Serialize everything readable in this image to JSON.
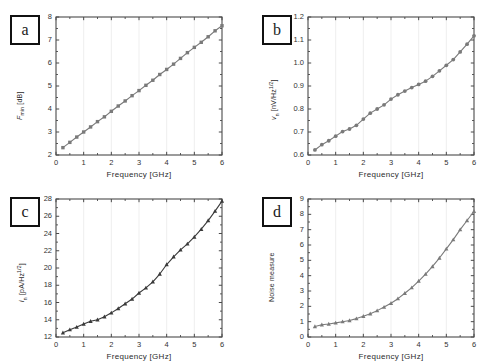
{
  "figure": {
    "width": 504,
    "height": 364,
    "background": "#ffffff",
    "line_color": "#7a7a7a",
    "marker_color": "#6e6e6e",
    "dark_line_color": "#3a3a3a",
    "axis_color": "#4a4a4a",
    "grid_color": "#e8e8e8"
  },
  "panels": {
    "a": {
      "tag": "a"
    },
    "b": {
      "tag": "b"
    },
    "c": {
      "tag": "c"
    },
    "d": {
      "tag": "d"
    }
  },
  "chart_data": [
    {
      "id": "a",
      "type": "line",
      "title": "",
      "panel_label": "a",
      "xlabel": "Frequency [GHz]",
      "ylabel": "F_min [dB]",
      "ylabel_parts": {
        "base": "F",
        "sub": "min",
        "unit": "[dB]"
      },
      "xlim": [
        0,
        6
      ],
      "ylim": [
        2,
        8
      ],
      "xticks": [
        0,
        1,
        2,
        3,
        4,
        5,
        6
      ],
      "xticklabels": [
        "0",
        "1",
        "2",
        "3",
        "4",
        "5",
        "6"
      ],
      "yticks": [
        2,
        3,
        4,
        5,
        6,
        7,
        8
      ],
      "yticklabels": [
        "2",
        "3",
        "4",
        "5",
        "6",
        "7",
        "8"
      ],
      "grid": true,
      "marker": "square",
      "line_color": "#7a7a7a",
      "x": [
        0.25,
        0.5,
        0.75,
        1.0,
        1.25,
        1.5,
        1.75,
        2.0,
        2.25,
        2.5,
        2.75,
        3.0,
        3.25,
        3.5,
        3.75,
        4.0,
        4.25,
        4.5,
        4.75,
        5.0,
        5.25,
        5.5,
        5.75,
        6.0
      ],
      "y": [
        2.32,
        2.55,
        2.78,
        3.0,
        3.22,
        3.45,
        3.66,
        3.9,
        4.13,
        4.35,
        4.58,
        4.8,
        5.03,
        5.25,
        5.5,
        5.72,
        5.95,
        6.2,
        6.45,
        6.68,
        6.9,
        7.14,
        7.4,
        7.62
      ]
    },
    {
      "id": "b",
      "type": "line",
      "title": "",
      "panel_label": "b",
      "xlabel": "Frequency [GHz]",
      "ylabel": "v_n [nV/Hz^1/2]",
      "ylabel_parts": {
        "base": "v",
        "sub": "n",
        "unit": "[nV/Hz",
        "sup": "1/2",
        "unit_end": "]"
      },
      "xlim": [
        0,
        6
      ],
      "ylim": [
        0.6,
        1.2
      ],
      "xticks": [
        0,
        1,
        2,
        3,
        4,
        5,
        6
      ],
      "xticklabels": [
        "0",
        "1",
        "2",
        "3",
        "4",
        "5",
        "6"
      ],
      "yticks": [
        0.6,
        0.7,
        0.8,
        0.9,
        1.0,
        1.1,
        1.2
      ],
      "yticklabels": [
        "0.6",
        "0.7",
        "0.8",
        "0.9",
        "1.0",
        "1.1",
        "1.2"
      ],
      "grid": true,
      "marker": "circle",
      "line_color": "#7a7a7a",
      "x": [
        0.25,
        0.5,
        0.75,
        1.0,
        1.25,
        1.5,
        1.75,
        2.0,
        2.25,
        2.5,
        2.75,
        3.0,
        3.25,
        3.5,
        3.75,
        4.0,
        4.25,
        4.5,
        4.75,
        5.0,
        5.25,
        5.5,
        5.75,
        6.0
      ],
      "y": [
        0.622,
        0.645,
        0.662,
        0.682,
        0.702,
        0.713,
        0.729,
        0.756,
        0.782,
        0.8,
        0.818,
        0.843,
        0.862,
        0.878,
        0.893,
        0.907,
        0.921,
        0.942,
        0.966,
        0.99,
        1.015,
        1.048,
        1.082,
        1.118,
        1.152,
        1.198
      ]
    },
    {
      "id": "c",
      "type": "line",
      "title": "",
      "panel_label": "c",
      "xlabel": "Frequency [GHz]",
      "ylabel": "i_n [pA/Hz^1/2]",
      "ylabel_parts": {
        "base": "i",
        "sub": "n",
        "unit": "[pA/Hz",
        "sup": "1/2",
        "unit_end": "]"
      },
      "xlim": [
        0,
        6
      ],
      "ylim": [
        12,
        28
      ],
      "xticks": [
        0,
        1,
        2,
        3,
        4,
        5,
        6
      ],
      "xticklabels": [
        "0",
        "1",
        "2",
        "3",
        "4",
        "5",
        "6"
      ],
      "yticks": [
        12,
        14,
        16,
        18,
        20,
        22,
        24,
        26,
        28
      ],
      "yticklabels": [
        "12",
        "14",
        "16",
        "18",
        "20",
        "22",
        "24",
        "26",
        "28"
      ],
      "grid": true,
      "marker": "triangle",
      "line_color": "#3a3a3a",
      "x": [
        0.25,
        0.5,
        0.75,
        1.0,
        1.25,
        1.5,
        1.75,
        2.0,
        2.25,
        2.5,
        2.75,
        3.0,
        3.25,
        3.5,
        3.75,
        4.0,
        4.25,
        4.5,
        4.75,
        5.0,
        5.25,
        5.5,
        5.75,
        6.0
      ],
      "y": [
        12.5,
        12.85,
        13.15,
        13.5,
        13.82,
        14.0,
        14.35,
        14.8,
        15.3,
        15.85,
        16.4,
        17.1,
        17.7,
        18.4,
        19.3,
        20.4,
        21.3,
        22.1,
        22.8,
        23.6,
        24.5,
        25.5,
        26.6,
        27.75
      ]
    },
    {
      "id": "d",
      "type": "line",
      "title": "",
      "panel_label": "d",
      "xlabel": "Frequency [GHz]",
      "ylabel": "Noise measure",
      "ylabel_parts": {
        "base": "Noise measure",
        "sub": "",
        "unit": ""
      },
      "xlim": [
        0,
        6
      ],
      "ylim": [
        0,
        9
      ],
      "xticks": [
        0,
        1,
        2,
        3,
        4,
        5,
        6
      ],
      "xticklabels": [
        "0",
        "1",
        "2",
        "3",
        "4",
        "5",
        "6"
      ],
      "yticks": [
        0,
        1,
        2,
        3,
        4,
        5,
        6,
        7,
        8,
        9
      ],
      "yticklabels": [
        "0",
        "1",
        "2",
        "3",
        "4",
        "5",
        "6",
        "7",
        "8",
        "9"
      ],
      "grid": true,
      "marker": "triangle",
      "line_color": "#7a7a7a",
      "x": [
        0.25,
        0.5,
        0.75,
        1.0,
        1.25,
        1.5,
        1.75,
        2.0,
        2.25,
        2.5,
        2.75,
        3.0,
        3.25,
        3.5,
        3.75,
        4.0,
        4.25,
        4.5,
        4.75,
        5.0,
        5.25,
        5.5,
        5.75,
        6.0
      ],
      "y": [
        0.68,
        0.8,
        0.85,
        0.92,
        1.0,
        1.08,
        1.2,
        1.35,
        1.52,
        1.72,
        1.95,
        2.2,
        2.5,
        2.85,
        3.22,
        3.65,
        4.1,
        4.6,
        5.15,
        5.75,
        6.35,
        7.0,
        7.6,
        8.2
      ]
    }
  ]
}
